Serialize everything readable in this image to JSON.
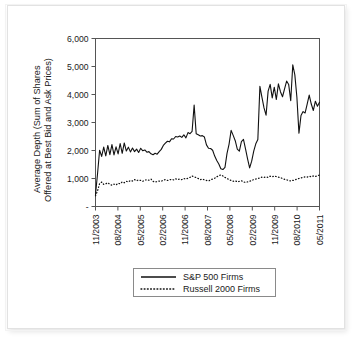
{
  "chart_data": {
    "type": "line",
    "title": "",
    "xlabel": "",
    "ylabel": "Average Depth (Sum of Shares Offered at Best Bid and Ask Prices)",
    "ylabel_line1": "Average Depth (Sum of Shares",
    "ylabel_line2": "Offered at Best Bid and Ask Prices)",
    "ylim": [
      0,
      6000
    ],
    "ytick_labels": [
      "6,000",
      "5,000",
      "4,000",
      "3,000",
      "2,000",
      "1,000",
      "-"
    ],
    "ytick_values": [
      6000,
      5000,
      4000,
      3000,
      2000,
      1000,
      0
    ],
    "xtick_labels": [
      "11/2003",
      "08/2004",
      "05/2005",
      "02/2006",
      "11/2006",
      "08/2007",
      "05/2008",
      "02/2009",
      "11/2009",
      "08/2010",
      "05/2011"
    ],
    "x_start": "11/2003",
    "x_end": "05/2011",
    "grid": false,
    "legend_position": "below-plot",
    "series": [
      {
        "name": "S&P 500 Firms",
        "style": "solid",
        "color": "#111111",
        "values": [
          430,
          1180,
          2010,
          1790,
          2120,
          1810,
          2180,
          1850,
          2210,
          1840,
          2130,
          1880,
          2250,
          1900,
          2270,
          1980,
          2120,
          1950,
          2090,
          1960,
          2050,
          1930,
          2080,
          1990,
          2020,
          1940,
          1960,
          1880,
          1850,
          1900,
          1870,
          1960,
          2040,
          2180,
          2260,
          2330,
          2310,
          2420,
          2410,
          2500,
          2480,
          2520,
          2470,
          2560,
          2450,
          2640,
          2600,
          2680,
          3620,
          2600,
          2560,
          2520,
          2530,
          2480,
          2200,
          2080,
          2070,
          2010,
          1800,
          1640,
          1520,
          1350,
          1320,
          1400,
          1900,
          2230,
          2720,
          2540,
          2350,
          2050,
          1980,
          2320,
          2400,
          2060,
          1700,
          1380,
          1620,
          1980,
          2240,
          2390,
          4290,
          3900,
          3520,
          3260,
          4120,
          4360,
          3880,
          4260,
          3820,
          4380,
          4100,
          3920,
          4200,
          4480,
          4360,
          3780,
          5060,
          4700,
          3900,
          2620,
          3250,
          3390,
          3340,
          3660,
          3980,
          3660,
          3430,
          3760,
          3580,
          3720
        ]
      },
      {
        "name": "Russell 2000 Firms",
        "style": "dotted",
        "color": "#111111",
        "values": [
          380,
          560,
          820,
          870,
          790,
          810,
          850,
          790,
          760,
          800,
          770,
          830,
          810,
          880,
          850,
          900,
          880,
          930,
          910,
          960,
          920,
          950,
          930,
          900,
          940,
          960,
          940,
          980,
          900,
          870,
          890,
          910,
          900,
          940,
          960,
          930,
          950,
          970,
          950,
          990,
          960,
          980,
          960,
          1000,
          980,
          1010,
          1040,
          1090,
          1060,
          1030,
          1000,
          960,
          980,
          950,
          930,
          910,
          950,
          980,
          1010,
          1060,
          1100,
          1130,
          1090,
          1040,
          1000,
          960,
          930,
          900,
          920,
          880,
          900,
          920,
          880,
          860,
          880,
          900,
          930,
          960,
          980,
          1000,
          1020,
          1050,
          1040,
          1060,
          1040,
          1080,
          1060,
          1090,
          1070,
          1050,
          1030,
          1000,
          970,
          950,
          930,
          910,
          930,
          950,
          980,
          1000,
          1020,
          1040,
          1060,
          1050,
          1080,
          1060,
          1090,
          1070,
          1100,
          1120
        ]
      }
    ]
  },
  "legend": {
    "items": [
      {
        "label": "S&P 500 Firms",
        "style": "solid"
      },
      {
        "label": "Russell 2000 Firms",
        "style": "dotted"
      }
    ]
  }
}
